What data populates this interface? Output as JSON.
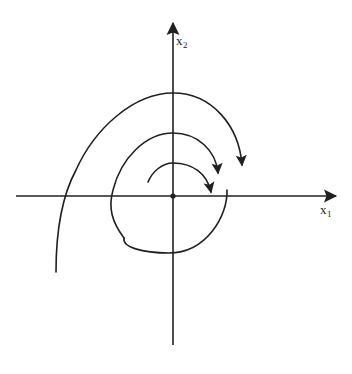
{
  "figure": {
    "kind": "phase-portrait",
    "background_color": "#ffffff",
    "stroke_color": "#231f20",
    "axis_stroke_width": 1.6,
    "curve_stroke_width": 1.6,
    "origin": {
      "x": 173,
      "y": 196
    },
    "origin_dot_radius": 2.6
  },
  "axes": {
    "horizontal": {
      "name": "x1",
      "label_text": "x",
      "label_subscript": "1",
      "x_start": 16,
      "x_end": 340,
      "y": 196,
      "arrow_at": "right"
    },
    "vertical": {
      "name": "x2",
      "label_text": "x",
      "label_subscript": "2",
      "y_start": 345,
      "y_end": 18,
      "x": 173,
      "arrow_at": "top"
    }
  },
  "chart_data": {
    "type": "line",
    "title": "",
    "xlabel": "x1",
    "ylabel": "x2",
    "grid": false,
    "legend": null,
    "spiral": {
      "direction": "clockwise",
      "sense": "inward",
      "turns": 2.6,
      "tail_end": {
        "x": 56,
        "y": 272
      },
      "outer_top": {
        "x": 173,
        "y": 93
      },
      "second_top": {
        "x": 173,
        "y": 133
      },
      "inner_top": {
        "x": 173,
        "y": 163
      },
      "outer_left": {
        "x": 76,
        "y": 196
      },
      "second_left": {
        "x": 113,
        "y": 196
      },
      "outer_right": {
        "x": 242,
        "y": 190
      },
      "second_right": {
        "x": 227,
        "y": 190
      },
      "inner_right": {
        "x": 212,
        "y": 186
      },
      "bottom_loop": {
        "x": 169,
        "y": 253
      },
      "inner_arc_start": {
        "x": 148,
        "y": 182
      }
    },
    "arrowheads": [
      {
        "name": "arrowhead-outer-arm",
        "x": 242,
        "y": 190,
        "direction": "down"
      },
      {
        "name": "arrowhead-middle-arm",
        "x": 215,
        "y": 159,
        "direction": "down-right"
      },
      {
        "name": "arrowhead-inner-arm",
        "x": 213,
        "y": 184,
        "direction": "down-right"
      }
    ]
  },
  "labels": {
    "x2": {
      "base": "x",
      "sub": "2"
    },
    "x1": {
      "base": "x",
      "sub": "1"
    }
  }
}
